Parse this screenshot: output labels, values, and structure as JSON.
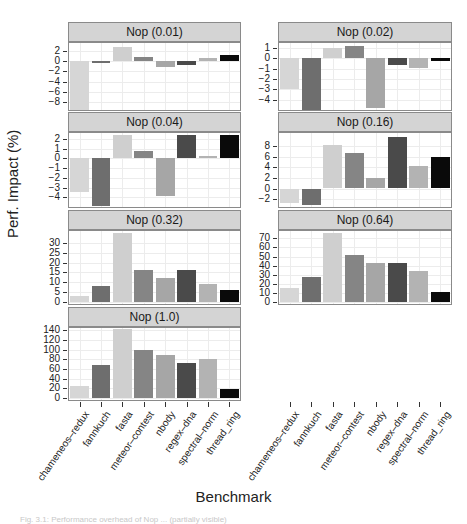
{
  "chart_data": {
    "type": "bar",
    "layout": "faceted 2-column lattice (trellis) bar chart",
    "ylabel": "Perf. Impact (%)",
    "xlabel": "Benchmark",
    "grid": true,
    "legend": null,
    "categories": [
      "chameneos–redux",
      "fannkuch",
      "fasta",
      "meteor–contest",
      "nbody",
      "regex–dna",
      "spectral–norm",
      "thread_ring"
    ],
    "bar_colors": [
      "#d6d6d6",
      "#6e6e6e",
      "#cfcfcf",
      "#858585",
      "#a6a6a6",
      "#4a4a4a",
      "#b3b3b3",
      "#0a0a0a"
    ],
    "panels": [
      {
        "title": "Nop (0.01)",
        "ylim": [
          -9.5,
          3.5
        ],
        "yticks": [
          2,
          0,
          -2,
          -4,
          -6,
          -8
        ],
        "values": [
          -9.5,
          -0.2,
          2.8,
          0.8,
          -1.2,
          -0.7,
          0.6,
          1.2
        ]
      },
      {
        "title": "Nop (0.02)",
        "ylim": [
          -5,
          1.5
        ],
        "yticks": [
          1,
          0,
          -1,
          -2,
          -3,
          -4
        ],
        "values": [
          -3.0,
          -5.0,
          1.0,
          1.2,
          -4.8,
          -0.6,
          -0.9,
          -0.2
        ]
      },
      {
        "title": "Nop (0.04)",
        "ylim": [
          -5,
          2.6
        ],
        "yticks": [
          2,
          1,
          0,
          -1,
          -2,
          -3,
          -4
        ],
        "values": [
          -3.5,
          -4.9,
          2.4,
          0.8,
          -3.9,
          2.4,
          0.2,
          2.4
        ]
      },
      {
        "title": "Nop (0.16)",
        "ylim": [
          -3.5,
          10.5
        ],
        "yticks": [
          8,
          6,
          4,
          2,
          0,
          -2
        ],
        "values": [
          -2.8,
          -3.2,
          8.2,
          6.8,
          2.0,
          9.8,
          4.2,
          6.0
        ]
      },
      {
        "title": "Nop (0.32)",
        "ylim": [
          -1,
          36
        ],
        "yticks": [
          30,
          25,
          20,
          15,
          10,
          5,
          0
        ],
        "values": [
          3,
          8,
          35,
          16,
          12,
          16,
          9,
          6
        ]
      },
      {
        "title": "Nop (0.64)",
        "ylim": [
          -2,
          78
        ],
        "yticks": [
          70,
          60,
          50,
          40,
          30,
          20,
          10,
          0
        ],
        "values": [
          16,
          28,
          76,
          52,
          43,
          43,
          34,
          11
        ]
      },
      {
        "title": "Nop (1.0)",
        "ylim": [
          -4,
          145
        ],
        "yticks": [
          140,
          120,
          100,
          80,
          60,
          40,
          20,
          0
        ],
        "values": [
          25,
          69,
          142,
          100,
          89,
          72,
          81,
          19
        ]
      }
    ]
  },
  "caption": "Fig. 3.1: Performance overhead of Nop ... (partially visible)"
}
